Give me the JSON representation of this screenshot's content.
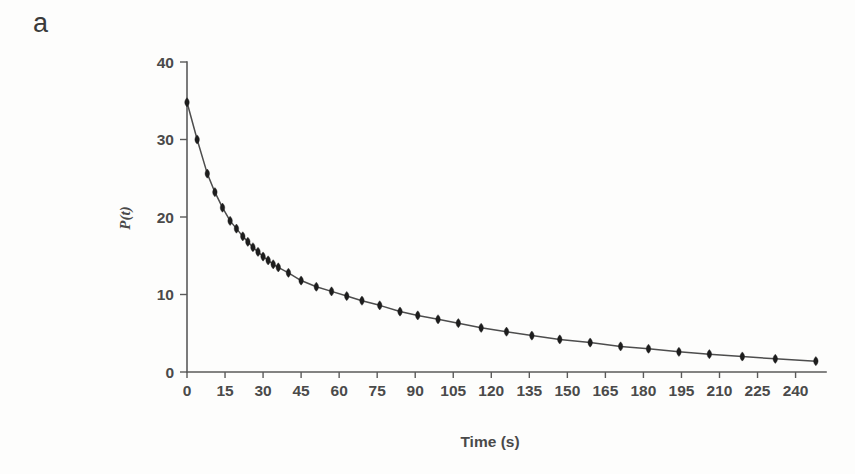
{
  "figure": {
    "panel_label": "a",
    "background_color": "#fdfdfc",
    "ink_color": "#4a4a4a",
    "marker_color": "#1d1d1d"
  },
  "chart_data": {
    "type": "scatter",
    "title": "",
    "subtitle": "",
    "xlabel": "Time (s)",
    "ylabel": "P(t)",
    "xlim": [
      0,
      252
    ],
    "ylim": [
      0,
      40
    ],
    "xticks": [
      0,
      15,
      30,
      45,
      60,
      75,
      90,
      105,
      120,
      135,
      150,
      165,
      180,
      195,
      210,
      225,
      240
    ],
    "xticklabels": [
      "0",
      "15",
      "30",
      "45",
      "60",
      "75",
      "90",
      "105",
      "120",
      "135",
      "150",
      "165",
      "180",
      "195",
      "210",
      "225",
      "240"
    ],
    "yticks": [
      0,
      10,
      20,
      30,
      40
    ],
    "yticklabels": [
      "0",
      "10",
      "20",
      "30",
      "40"
    ],
    "grid": false,
    "legend": null,
    "marker_style": "filled-diamond",
    "line_style": "solid",
    "series": [
      {
        "name": "P(t)",
        "x": [
          0,
          4,
          8,
          11,
          14,
          17,
          19.5,
          22,
          24,
          26,
          28,
          30,
          32,
          34,
          36,
          40,
          45,
          51,
          57,
          63,
          69,
          76,
          84,
          91,
          99,
          107,
          116,
          126,
          136,
          147,
          159,
          171,
          182,
          194,
          206,
          219,
          232,
          248
        ],
        "y": [
          34.8,
          30.0,
          25.6,
          23.2,
          21.2,
          19.5,
          18.5,
          17.5,
          16.8,
          16.1,
          15.5,
          14.9,
          14.4,
          13.9,
          13.5,
          12.8,
          11.8,
          11.0,
          10.4,
          9.8,
          9.2,
          8.6,
          7.8,
          7.3,
          6.8,
          6.3,
          5.7,
          5.2,
          4.7,
          4.2,
          3.8,
          3.3,
          3.0,
          2.6,
          2.3,
          2.0,
          1.7,
          1.4
        ]
      }
    ],
    "annotations": []
  }
}
